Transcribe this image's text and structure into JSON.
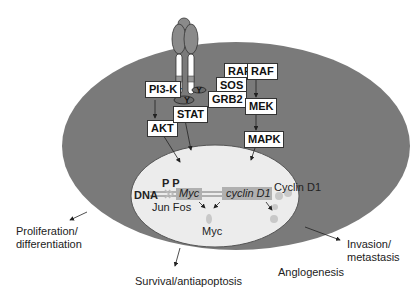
{
  "diagram": {
    "type": "signaling-pathway",
    "colors": {
      "cytoplasm": "#7a7a7a",
      "nucleus": "#ececec",
      "receptor": "#8a8a8a",
      "gene_box": "#b0b0b0",
      "protein_dot": "#c8c8c8"
    },
    "receptor": {
      "name": "receptor-dimer"
    },
    "proteins": {
      "pi3k": "PI3-K",
      "akt": "AKT",
      "stat": "STAT",
      "raf1": "RAF",
      "raf2": "RAF",
      "sos": "SOS",
      "grb2": "GRB2",
      "mek": "MEK",
      "mapk": "MAPK"
    },
    "nucleus": {
      "pp": "P P",
      "dna": "DNA",
      "jun_fos": "Jun Fos",
      "myc_gene": "Myc",
      "cyclin_gene": "cyclin D1",
      "myc_protein": "Myc",
      "cyclin_protein": "Cyclin D1"
    },
    "outcomes": {
      "proliferation": "Proliferation/",
      "proliferation2": "differentiation",
      "survival": "Survival/antiapoptosis",
      "invasion": "Invasion/",
      "invasion2": "metastasis",
      "angiogenesis": "Anglogenesis"
    }
  }
}
